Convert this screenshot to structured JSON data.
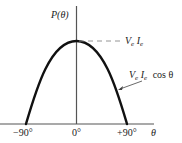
{
  "diagram": {
    "type": "function-plot",
    "y_axis_label": "P(θ)",
    "x_axis_label": "θ",
    "x_ticks": [
      "−90°",
      "0°",
      "+90°"
    ],
    "peak_label": {
      "V": "V",
      "V_sub": "e",
      "I": "I",
      "I_sub": "e"
    },
    "curve_label": {
      "V": "V",
      "V_sub": "e",
      "I": "I",
      "I_sub": "e",
      "func": "cos θ"
    },
    "colors": {
      "axis": "#555555",
      "curve": "#111111",
      "dash": "#888888",
      "text": "#222222"
    }
  }
}
